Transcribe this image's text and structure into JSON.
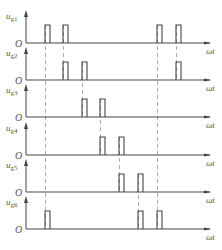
{
  "figure": {
    "x_axis_label": "ωt",
    "origin_label": "O",
    "colors": {
      "line": "#444444",
      "dash": "#999999",
      "text": "#555555"
    },
    "layout": {
      "axis_x": 26,
      "axis_end_x": 210,
      "pulse_width": 5,
      "pulse_height": 18,
      "row_spacing": 37.2
    },
    "rows": [
      {
        "label_main": "u",
        "label_sub": "g1",
        "baseline_y": 43,
        "pulses": [
          45,
          63,
          157,
          176
        ]
      },
      {
        "label_main": "u",
        "label_sub": "g2",
        "baseline_y": 80,
        "pulses": [
          63,
          82,
          176
        ]
      },
      {
        "label_main": "u",
        "label_sub": "g3",
        "baseline_y": 117,
        "pulses": [
          82,
          100
        ]
      },
      {
        "label_main": "u",
        "label_sub": "g4",
        "baseline_y": 155,
        "pulses": [
          100,
          119
        ]
      },
      {
        "label_main": "u",
        "label_sub": "g5",
        "baseline_y": 192,
        "pulses": [
          119,
          138
        ]
      },
      {
        "label_main": "u",
        "label_sub": "g6",
        "baseline_y": 229,
        "pulses": [
          45,
          138,
          157
        ]
      }
    ],
    "dashed_lines": [
      {
        "x": 45,
        "from_row": 0,
        "to_row": 5
      },
      {
        "x": 63,
        "from_row": 0,
        "to_row": 1
      },
      {
        "x": 82,
        "from_row": 1,
        "to_row": 2
      },
      {
        "x": 100,
        "from_row": 2,
        "to_row": 3
      },
      {
        "x": 119,
        "from_row": 3,
        "to_row": 4
      },
      {
        "x": 138,
        "from_row": 4,
        "to_row": 5
      },
      {
        "x": 157,
        "from_row": 0,
        "to_row": 5
      },
      {
        "x": 176,
        "from_row": 0,
        "to_row": 1
      }
    ]
  }
}
